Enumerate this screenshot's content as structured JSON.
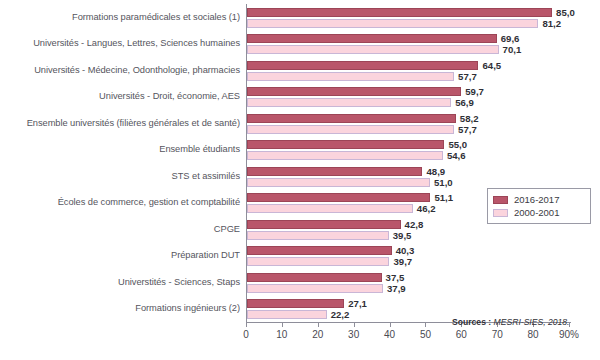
{
  "chart_data": {
    "type": "bar",
    "orientation": "horizontal",
    "title": "",
    "subtitle": "",
    "xlabel": "",
    "ylabel": "",
    "xlim": [
      0,
      90
    ],
    "xticks": [
      0,
      10,
      20,
      30,
      40,
      50,
      60,
      70,
      80,
      90
    ],
    "xtick_labels": [
      "0",
      "10",
      "20",
      "30",
      "40",
      "50",
      "60",
      "70",
      "80",
      "90%"
    ],
    "grid": false,
    "legend_position": "right-middle",
    "value_label_format": "comma-decimal-one",
    "categories": [
      "Formations paramédicales et sociales (1)",
      "Universités - Langues, Lettres, Sciences humaines",
      "Universités - Médecine, Odonthologie, pharmacies",
      "Universités - Droit, économie, AES",
      "Ensemble universités (filières générales et de santé)",
      "Ensemble étudiants",
      "STS et assimilés",
      "Écoles de commerce, gestion et comptabilité",
      "CPGE",
      "Préparation DUT",
      "Universtités - Sciences, Staps",
      "Formations ingénieurs (2)"
    ],
    "series": [
      {
        "name": "2016-2017",
        "color": "#b9566a",
        "values": [
          85.0,
          69.6,
          64.5,
          59.7,
          58.2,
          55.0,
          48.9,
          51.1,
          42.8,
          40.3,
          37.5,
          27.1
        ],
        "value_labels": [
          "85,0",
          "69,6",
          "64,5",
          "59,7",
          "58,2",
          "55,0",
          "48,9",
          "51,1",
          "42,8",
          "40,3",
          "37,5",
          "27,1"
        ]
      },
      {
        "name": "2000-2001",
        "color": "#fbd4dd",
        "values": [
          81.2,
          70.1,
          57.7,
          56.9,
          57.7,
          54.6,
          51.0,
          46.2,
          39.5,
          39.7,
          37.9,
          22.2
        ],
        "value_labels": [
          "81,2",
          "70,1",
          "57,7",
          "56,9",
          "57,7",
          "54,6",
          "51,0",
          "46,2",
          "39,5",
          "39,7",
          "37,9",
          "22,2"
        ]
      }
    ]
  },
  "legend": {
    "entries": [
      {
        "label": "2016-2017"
      },
      {
        "label": "2000-2001"
      }
    ]
  },
  "source": {
    "label": "Sources :",
    "text": "MESRI-SIES, 2018."
  }
}
